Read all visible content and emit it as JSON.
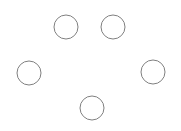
{
  "diagram": {
    "background": "#ffffff",
    "stroke": "#808080",
    "fill": "#ffffff",
    "stroke_width": 1,
    "nodes": [
      {
        "id": "node-top-left",
        "cx": 66,
        "cy": 27,
        "r": 12
      },
      {
        "id": "node-top-right",
        "cx": 113,
        "cy": 27,
        "r": 12
      },
      {
        "id": "node-left",
        "cx": 29,
        "cy": 73,
        "r": 12
      },
      {
        "id": "node-right",
        "cx": 153,
        "cy": 72,
        "r": 12
      },
      {
        "id": "node-bottom",
        "cx": 92,
        "cy": 108,
        "r": 12
      }
    ]
  }
}
